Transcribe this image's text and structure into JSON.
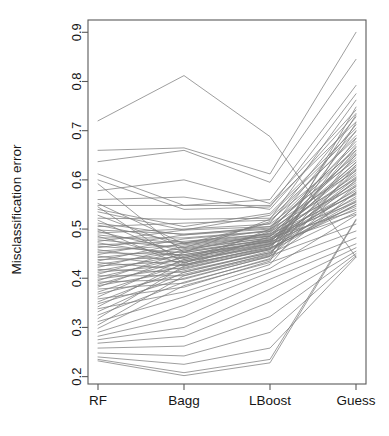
{
  "chart_data": {
    "type": "line",
    "title": "",
    "subtitle": "",
    "xlabel": "",
    "ylabel": "Misclassification error",
    "categories": [
      "RF",
      "Bagg",
      "LBoost",
      "Guess"
    ],
    "x_tick_labels": [
      "RF",
      "Bagg",
      "LBoost",
      "Guess"
    ],
    "y_tick_labels": [
      "0.2",
      "0.3",
      "0.4",
      "0.5",
      "0.6",
      "0.7",
      "0.8",
      "0.9"
    ],
    "y_tick_values": [
      0.2,
      0.3,
      0.4,
      0.5,
      0.6,
      0.7,
      0.8,
      0.9
    ],
    "ylim": [
      0.185,
      0.925
    ],
    "xlim": [
      0,
      3
    ],
    "grid": false,
    "legend": null,
    "legend_position": "none",
    "annotations": [],
    "line_color": "#7d7d7d",
    "line_width": 0.75,
    "axis_color": "#5a5a5a",
    "series_note": "Parallel-coordinates profile plot: one polyline per dataset across four classifiers.",
    "series": [
      {
        "name": "d01",
        "values": [
          0.72,
          0.812,
          0.688,
          0.443
        ]
      },
      {
        "name": "d02",
        "values": [
          0.66,
          0.665,
          0.612,
          0.9
        ]
      },
      {
        "name": "d03",
        "values": [
          0.637,
          0.66,
          0.595,
          0.845
        ]
      },
      {
        "name": "d04",
        "values": [
          0.612,
          0.548,
          0.56,
          0.792
        ]
      },
      {
        "name": "d05",
        "values": [
          0.6,
          0.54,
          0.545,
          0.775
        ]
      },
      {
        "name": "d06",
        "values": [
          0.592,
          0.452,
          0.52,
          0.762
        ]
      },
      {
        "name": "d07",
        "values": [
          0.578,
          0.6,
          0.552,
          0.742
        ]
      },
      {
        "name": "d08",
        "values": [
          0.56,
          0.565,
          0.54,
          0.735
        ]
      },
      {
        "name": "d09",
        "values": [
          0.552,
          0.47,
          0.512,
          0.728
        ]
      },
      {
        "name": "d10",
        "values": [
          0.548,
          0.548,
          0.548,
          0.718
        ]
      },
      {
        "name": "d11",
        "values": [
          0.545,
          0.43,
          0.5,
          0.712
        ]
      },
      {
        "name": "d12",
        "values": [
          0.54,
          0.505,
          0.532,
          0.705
        ]
      },
      {
        "name": "d13",
        "values": [
          0.535,
          0.498,
          0.528,
          0.698
        ]
      },
      {
        "name": "d14",
        "values": [
          0.528,
          0.462,
          0.515,
          0.69
        ]
      },
      {
        "name": "d15",
        "values": [
          0.522,
          0.52,
          0.522,
          0.685
        ]
      },
      {
        "name": "d16",
        "values": [
          0.518,
          0.44,
          0.495,
          0.678
        ]
      },
      {
        "name": "d17",
        "values": [
          0.512,
          0.488,
          0.505,
          0.672
        ]
      },
      {
        "name": "d18",
        "values": [
          0.508,
          0.472,
          0.498,
          0.665
        ]
      },
      {
        "name": "d19",
        "values": [
          0.505,
          0.512,
          0.518,
          0.66
        ]
      },
      {
        "name": "d20",
        "values": [
          0.5,
          0.425,
          0.485,
          0.655
        ]
      },
      {
        "name": "d21",
        "values": [
          0.498,
          0.49,
          0.502,
          0.65
        ]
      },
      {
        "name": "d22",
        "values": [
          0.495,
          0.455,
          0.492,
          0.645
        ]
      },
      {
        "name": "d23",
        "values": [
          0.492,
          0.5,
          0.51,
          0.64
        ]
      },
      {
        "name": "d24",
        "values": [
          0.488,
          0.47,
          0.488,
          0.635
        ]
      },
      {
        "name": "d25",
        "values": [
          0.485,
          0.438,
          0.478,
          0.63
        ]
      },
      {
        "name": "d26",
        "values": [
          0.482,
          0.482,
          0.496,
          0.626
        ]
      },
      {
        "name": "d27",
        "values": [
          0.478,
          0.462,
          0.485,
          0.622
        ]
      },
      {
        "name": "d28",
        "values": [
          0.475,
          0.498,
          0.505,
          0.618
        ]
      },
      {
        "name": "d29",
        "values": [
          0.472,
          0.445,
          0.475,
          0.614
        ]
      },
      {
        "name": "d30",
        "values": [
          0.468,
          0.475,
          0.49,
          0.61
        ]
      },
      {
        "name": "d31",
        "values": [
          0.465,
          0.452,
          0.48,
          0.606
        ]
      },
      {
        "name": "d32",
        "values": [
          0.462,
          0.488,
          0.5,
          0.602
        ]
      },
      {
        "name": "d33",
        "values": [
          0.458,
          0.432,
          0.47,
          0.598
        ]
      },
      {
        "name": "d34",
        "values": [
          0.455,
          0.468,
          0.486,
          0.594
        ]
      },
      {
        "name": "d35",
        "values": [
          0.452,
          0.448,
          0.476,
          0.59
        ]
      },
      {
        "name": "d36",
        "values": [
          0.448,
          0.48,
          0.495,
          0.586
        ]
      },
      {
        "name": "d37",
        "values": [
          0.445,
          0.425,
          0.465,
          0.582
        ]
      },
      {
        "name": "d38",
        "values": [
          0.442,
          0.46,
          0.482,
          0.578
        ]
      },
      {
        "name": "d39",
        "values": [
          0.438,
          0.442,
          0.472,
          0.574
        ]
      },
      {
        "name": "d40",
        "values": [
          0.435,
          0.472,
          0.49,
          0.57
        ]
      },
      {
        "name": "d41",
        "values": [
          0.432,
          0.418,
          0.46,
          0.566
        ]
      },
      {
        "name": "d42",
        "values": [
          0.428,
          0.455,
          0.478,
          0.562
        ]
      },
      {
        "name": "d43",
        "values": [
          0.425,
          0.435,
          0.468,
          0.558
        ]
      },
      {
        "name": "d44",
        "values": [
          0.422,
          0.465,
          0.486,
          0.554
        ]
      },
      {
        "name": "d45",
        "values": [
          0.418,
          0.412,
          0.455,
          0.55
        ]
      },
      {
        "name": "d46",
        "values": [
          0.415,
          0.448,
          0.474,
          0.546
        ]
      },
      {
        "name": "d47",
        "values": [
          0.412,
          0.428,
          0.462,
          0.542
        ]
      },
      {
        "name": "d48",
        "values": [
          0.408,
          0.458,
          0.482,
          0.538
        ]
      },
      {
        "name": "d49",
        "values": [
          0.405,
          0.405,
          0.45,
          0.534
        ]
      },
      {
        "name": "d50",
        "values": [
          0.402,
          0.442,
          0.47,
          0.53
        ]
      },
      {
        "name": "d51",
        "values": [
          0.398,
          0.422,
          0.458,
          0.556
        ]
      },
      {
        "name": "d52",
        "values": [
          0.395,
          0.452,
          0.478,
          0.572
        ]
      },
      {
        "name": "d53",
        "values": [
          0.392,
          0.398,
          0.445,
          0.588
        ]
      },
      {
        "name": "d54",
        "values": [
          0.388,
          0.435,
          0.466,
          0.604
        ]
      },
      {
        "name": "d55",
        "values": [
          0.385,
          0.415,
          0.452,
          0.62
        ]
      },
      {
        "name": "d56",
        "values": [
          0.382,
          0.445,
          0.474,
          0.636
        ]
      },
      {
        "name": "d57",
        "values": [
          0.378,
          0.39,
          0.44,
          0.652
        ]
      },
      {
        "name": "d58",
        "values": [
          0.372,
          0.428,
          0.462,
          0.668
        ]
      },
      {
        "name": "d59",
        "values": [
          0.368,
          0.408,
          0.448,
          0.684
        ]
      },
      {
        "name": "d60",
        "values": [
          0.362,
          0.438,
          0.47,
          0.7
        ]
      },
      {
        "name": "d61",
        "values": [
          0.358,
          0.382,
          0.435,
          0.716
        ]
      },
      {
        "name": "d62",
        "values": [
          0.352,
          0.42,
          0.458,
          0.732
        ]
      },
      {
        "name": "d63",
        "values": [
          0.348,
          0.4,
          0.444,
          0.748
        ]
      },
      {
        "name": "d64",
        "values": [
          0.342,
          0.432,
          0.466,
          0.66
        ]
      },
      {
        "name": "d65",
        "values": [
          0.338,
          0.372,
          0.428,
          0.63
        ]
      },
      {
        "name": "d66",
        "values": [
          0.332,
          0.412,
          0.452,
          0.6
        ]
      },
      {
        "name": "d67",
        "values": [
          0.325,
          0.392,
          0.438,
          0.575
        ]
      },
      {
        "name": "d68",
        "values": [
          0.318,
          0.425,
          0.46,
          0.55
        ]
      },
      {
        "name": "d69",
        "values": [
          0.312,
          0.362,
          0.42,
          0.528
        ]
      },
      {
        "name": "d70",
        "values": [
          0.305,
          0.405,
          0.446,
          0.51
        ]
      },
      {
        "name": "d71",
        "values": [
          0.298,
          0.385,
          0.432,
          0.496
        ]
      },
      {
        "name": "d72",
        "values": [
          0.29,
          0.345,
          0.412,
          0.482
        ]
      },
      {
        "name": "d73",
        "values": [
          0.282,
          0.322,
          0.398,
          0.47
        ]
      },
      {
        "name": "d74",
        "values": [
          0.275,
          0.3,
          0.378,
          0.462
        ]
      },
      {
        "name": "d75",
        "values": [
          0.268,
          0.282,
          0.352,
          0.455
        ]
      },
      {
        "name": "d76",
        "values": [
          0.258,
          0.262,
          0.322,
          0.45
        ]
      },
      {
        "name": "d77",
        "values": [
          0.248,
          0.242,
          0.29,
          0.446
        ]
      },
      {
        "name": "d78",
        "values": [
          0.24,
          0.225,
          0.258,
          0.443
        ]
      },
      {
        "name": "d79",
        "values": [
          0.235,
          0.208,
          0.235,
          0.52
        ]
      },
      {
        "name": "d80",
        "values": [
          0.232,
          0.202,
          0.228,
          0.518
        ]
      }
    ]
  }
}
